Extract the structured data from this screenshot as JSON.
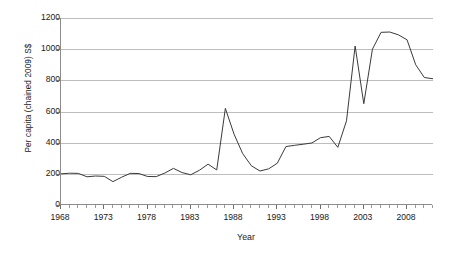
{
  "chart_data": {
    "type": "line",
    "title": "",
    "xlabel": "Year",
    "ylabel": "Per capita (chained 2009) S$",
    "xlim": [
      1968,
      2011
    ],
    "ylim": [
      0,
      1200
    ],
    "grid": true,
    "legend": null,
    "y_ticks": [
      0,
      200,
      400,
      600,
      800,
      1000,
      1200
    ],
    "y_tick_labels": [
      "0",
      "200",
      "400",
      "600",
      "800",
      "1000",
      "1200"
    ],
    "x_ticks": [
      1968,
      1973,
      1978,
      1983,
      1988,
      1993,
      1998,
      2003,
      2008
    ],
    "x_tick_labels": [
      "1968",
      "1973",
      "1978",
      "1983",
      "1988",
      "1993",
      "1998",
      "2003",
      "2008"
    ],
    "x_minor_tick_step": 1,
    "series": [
      {
        "name": "Per capita (chained 2009) S$",
        "color": "#3a3a3a",
        "x": [
          1968,
          1969,
          1970,
          1971,
          1972,
          1973,
          1974,
          1975,
          1976,
          1977,
          1978,
          1979,
          1980,
          1981,
          1982,
          1983,
          1984,
          1985,
          1986,
          1987,
          1988,
          1989,
          1990,
          1991,
          1992,
          1993,
          1994,
          1995,
          1996,
          1997,
          1998,
          1999,
          2000,
          2001,
          2002,
          2003,
          2004,
          2005,
          2006,
          2007,
          2008,
          2009,
          2010,
          2011
        ],
        "values": [
          200,
          204,
          203,
          181,
          186,
          184,
          150,
          178,
          203,
          202,
          183,
          182,
          205,
          235,
          208,
          194,
          223,
          262,
          225,
          620,
          455,
          330,
          252,
          218,
          232,
          268,
          375,
          383,
          390,
          398,
          432,
          440,
          370,
          540,
          1020,
          650,
          1000,
          1108,
          1110,
          1092,
          1060,
          900,
          818,
          810
        ]
      }
    ]
  },
  "axes": {
    "y_axis_title": "Per capita (chained 2009) S$",
    "x_axis_title": "Year"
  }
}
